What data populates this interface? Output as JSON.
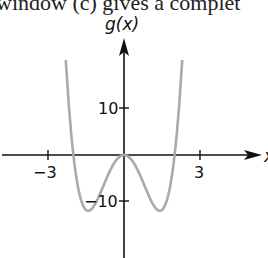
{
  "header_fragment": "window (c) gives a complet",
  "chart_data": {
    "type": "line",
    "title": "",
    "ylabel": "g(x)",
    "xlabel": "x",
    "x_ticks": [
      -3,
      3
    ],
    "x_tick_labels": [
      "−3",
      "3"
    ],
    "y_ticks": [
      10,
      -10
    ],
    "y_tick_labels": [
      "10",
      "−10"
    ],
    "xlim": [
      -3.0,
      5.0
    ],
    "ylim": [
      -20,
      22
    ],
    "grid": false,
    "series": [
      {
        "name": "g(x)",
        "color": "#a9a9a9",
        "formula": "3x^4 - 12x^2",
        "x": [
          -2.3,
          -2.2,
          -2.0,
          -1.8,
          -1.6,
          -1.414,
          -1.2,
          -1.0,
          -0.8,
          -0.6,
          -0.4,
          -0.2,
          0.0,
          0.2,
          0.4,
          0.6,
          0.8,
          1.0,
          1.2,
          1.414,
          1.6,
          1.8,
          2.0,
          2.2,
          2.3
        ],
        "values": [
          20.4,
          12.2,
          0.0,
          -7.4,
          -11.1,
          -12.0,
          -11.1,
          -9.0,
          -6.5,
          -3.9,
          -1.8,
          -0.5,
          0.0,
          -0.5,
          -1.8,
          -3.9,
          -6.5,
          -9.0,
          -11.1,
          -12.0,
          -11.1,
          -7.4,
          0.0,
          12.2,
          20.4
        ]
      }
    ],
    "key_points": {
      "roots": [
        -2,
        0,
        2
      ],
      "local_minima": [
        [
          -1.41,
          -12
        ],
        [
          1.41,
          -12
        ]
      ],
      "local_max": [
        0,
        0
      ]
    }
  }
}
